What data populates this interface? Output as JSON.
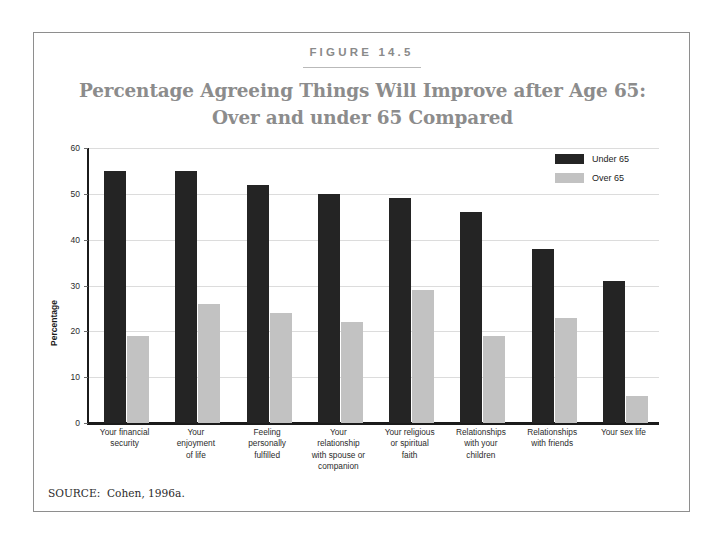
{
  "figure": {
    "number_label": "FIGURE 14.5",
    "title_line1": "Percentage Agreeing Things Will Improve after Age 65:",
    "title_line2": "Over and under 65 Compared",
    "source": "SOURCE:  Cohen, 1996a."
  },
  "legend": {
    "position": "top-right",
    "items": [
      {
        "label": "Under 65",
        "color": "#242424"
      },
      {
        "label": "Over 65",
        "color": "#c2c2c2"
      }
    ]
  },
  "colors": {
    "under_65": "#242424",
    "over_65": "#c2c2c2",
    "title_gray": "#8c8c8c",
    "figure_label_gray": "#8a8a8a",
    "gridline": "#dcdcdc",
    "axis": "#1b1b1b",
    "frame_border": "#8e8e8e"
  },
  "chart_data": {
    "type": "bar",
    "title": "Percentage Agreeing Things Will Improve after Age 65: Over and under 65 Compared",
    "xlabel": "",
    "ylabel": "Percentage",
    "ylim": [
      0,
      60
    ],
    "yticks": [
      0,
      10,
      20,
      30,
      40,
      50,
      60
    ],
    "ytick_labels": [
      "0",
      "10",
      "20",
      "30",
      "40",
      "50",
      "60"
    ],
    "grid": true,
    "grid_axis": "y",
    "legend_position": "upper right",
    "categories": [
      "Your financial security",
      "Your enjoyment of life",
      "Feeling personally fulfilled",
      "Your relationship with spouse or companion",
      "Your religious or spiritual faith",
      "Relationships with your children",
      "Relationships with friends",
      "Your sex life"
    ],
    "category_lines": [
      [
        "Your financial",
        "security"
      ],
      [
        "Your",
        "enjoyment",
        "of life"
      ],
      [
        "Feeling",
        "personally",
        "fulfilled"
      ],
      [
        "Your",
        "relationship",
        "with spouse or",
        "companion"
      ],
      [
        "Your religious",
        "or spiritual",
        "faith"
      ],
      [
        "Relationships",
        "with your",
        "children"
      ],
      [
        "Relationships",
        "with friends"
      ],
      [
        "Your sex life"
      ]
    ],
    "series": [
      {
        "name": "Under 65",
        "color": "#242424",
        "values": [
          55,
          55,
          52,
          50,
          49,
          46,
          38,
          31
        ]
      },
      {
        "name": "Over 65",
        "color": "#c2c2c2",
        "values": [
          19,
          26,
          24,
          22,
          29,
          19,
          23,
          6
        ]
      }
    ]
  }
}
